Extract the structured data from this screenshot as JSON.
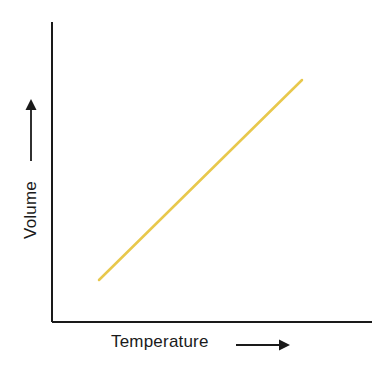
{
  "chart_data": {
    "type": "line",
    "title": "",
    "subtitle": "",
    "xlabel": "Temperature",
    "ylabel": "Volume",
    "xlabel_arrow": "right-arrow",
    "ylabel_arrow": "up-arrow",
    "grid": false,
    "legend": null,
    "xticks": [],
    "yticks": [],
    "xlim": [
      0,
      1
    ],
    "ylim": [
      0,
      1
    ],
    "annotations": [],
    "series": [
      {
        "name": "Volume vs Temperature",
        "color": "#e8c84c",
        "linewidth": 2.5,
        "x": [
          0.147,
          0.781
        ],
        "y": [
          0.14,
          0.807
        ],
        "points_px": [
          {
            "x": 99,
            "y": 280
          },
          {
            "x": 302,
            "y": 80
          }
        ]
      }
    ]
  },
  "figure": {
    "background_color": "#ffffff",
    "axis_color": "#1a1a1a",
    "axis_width": 2,
    "accent_color": "#e8c84c",
    "x_axis": {
      "x1": 52,
      "y1": 322,
      "x2": 372,
      "y2": 322
    },
    "y_axis": {
      "x1": 52,
      "y1": 22,
      "x2": 52,
      "y2": 322
    }
  },
  "labels": {
    "x_axis_label": "Temperature",
    "y_axis_label": "Volume"
  },
  "arrows": {
    "x_arrow": {
      "x1": 236,
      "y1": 345,
      "x2": 286,
      "y2": 345
    },
    "y_arrow": {
      "x1": 31,
      "y1": 160,
      "x2": 31,
      "y2": 101
    }
  }
}
